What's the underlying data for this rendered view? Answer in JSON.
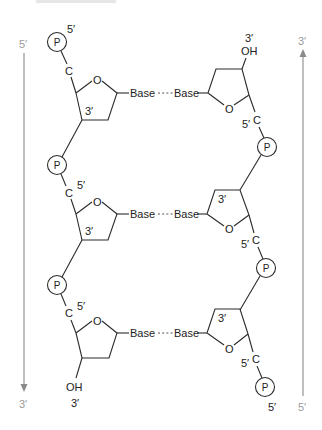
{
  "diagram": {
    "type": "dna-double-strand-structure",
    "left_strand": {
      "direction_top_label": "5′",
      "direction_bottom_label": "3′",
      "arrow_direction": "down",
      "top_phosphate": "P",
      "top_phosphate_label": "5′",
      "end_group": "OH",
      "end_label": "3′",
      "units": [
        {
          "phosphate": "P",
          "carbon": "C",
          "carbon_label": "",
          "ring_oxygen": "O",
          "ring_label": "3′",
          "base": "Base"
        },
        {
          "phosphate": "P",
          "carbon": "C",
          "carbon_label": "5′",
          "ring_oxygen": "O",
          "ring_label": "3′",
          "base": "Base"
        },
        {
          "phosphate": "P",
          "carbon": "C",
          "carbon_label": "5′",
          "ring_oxygen": "O",
          "ring_label": "",
          "base": "Base"
        }
      ]
    },
    "right_strand": {
      "direction_top_label": "3′",
      "direction_bottom_label": "5′",
      "arrow_direction": "up",
      "end_group": "OH",
      "end_label": "3′",
      "bottom_phosphate_label": "5′",
      "units": [
        {
          "base": "Base",
          "ring_oxygen": "O",
          "ring_label": "",
          "carbon": "C",
          "carbon_label": "5′",
          "phosphate": "P"
        },
        {
          "base": "Base",
          "ring_oxygen": "O",
          "ring_label": "3′",
          "carbon": "C",
          "carbon_label": "5′",
          "phosphate": "P"
        },
        {
          "base": "Base",
          "ring_oxygen": "O",
          "ring_label": "3′",
          "carbon": "C",
          "carbon_label": "5′",
          "phosphate": "P"
        }
      ]
    },
    "base_pair_connector": "hydrogen-bond-dashed"
  },
  "colors": {
    "line": "#2b2b2b",
    "direction_arrow": "#8a8a8a",
    "direction_label": "#9a9a9a"
  }
}
